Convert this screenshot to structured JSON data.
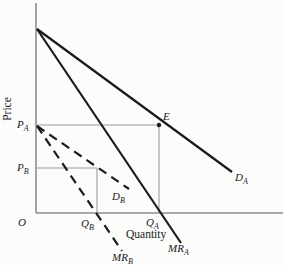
{
  "figure": {
    "background_color": "#fcfcfb",
    "curve_color": "#1a1a1a",
    "axis_color": "#8d8d8d",
    "guide_color": "#9a9a9a"
  },
  "chart_data": {
    "type": "line",
    "title": "",
    "xlabel": "Quantity",
    "ylabel": "Price",
    "units": "pixel coordinates, qualitative diagram (no numeric scale)",
    "axes": {
      "y_axis": {
        "from": [
          36,
          3
        ],
        "to": [
          36,
          213
        ]
      },
      "x_axis": {
        "from": [
          36,
          213
        ],
        "to": [
          283,
          213
        ]
      }
    },
    "series": [
      {
        "name": "demand-A",
        "label": "D",
        "sub": "A",
        "style": "solid",
        "points": [
          [
            37,
            29
          ],
          [
            232,
            172
          ]
        ],
        "label_at": [
          235,
          181
        ]
      },
      {
        "name": "marginal-revenue-A",
        "label": "MR",
        "sub": "A",
        "style": "solid",
        "points": [
          [
            37,
            29
          ],
          [
            181,
            243
          ]
        ],
        "label_at": [
          168,
          252
        ]
      },
      {
        "name": "demand-B",
        "label": "D",
        "sub": "B",
        "style": "dashed",
        "points": [
          [
            37,
            126
          ],
          [
            129,
            189
          ]
        ],
        "label_at": [
          112,
          200
        ]
      },
      {
        "name": "marginal-revenue-B",
        "label": "MR",
        "sub": "B",
        "style": "dashed",
        "points": [
          [
            37,
            126
          ],
          [
            122,
            251
          ]
        ],
        "label_at": [
          112,
          261
        ]
      }
    ],
    "guides": [
      {
        "name": "price-A-guide",
        "from": [
          36,
          125
        ],
        "to": [
          159,
          125
        ]
      },
      {
        "name": "quantity-A-guide",
        "from": [
          159,
          125
        ],
        "to": [
          159,
          213
        ]
      },
      {
        "name": "price-B-guide",
        "from": [
          36,
          168
        ],
        "to": [
          97,
          168
        ]
      },
      {
        "name": "quantity-B-guide",
        "from": [
          97,
          168
        ],
        "to": [
          97,
          213
        ]
      }
    ],
    "points": [
      {
        "name": "equilibrium-E",
        "label": "E",
        "sub": "",
        "x": 159,
        "y": 125,
        "dot": true,
        "label_at": [
          163,
          120
        ]
      }
    ],
    "tick_labels": [
      {
        "name": "price-A",
        "label": "P",
        "sub": "A",
        "at": [
          17,
          128
        ]
      },
      {
        "name": "price-B",
        "label": "P",
        "sub": "B",
        "at": [
          17,
          171
        ]
      },
      {
        "name": "origin",
        "label": "O",
        "sub": "",
        "at": [
          18,
          226
        ]
      },
      {
        "name": "quantity-B",
        "label": "Q",
        "sub": "B",
        "at": [
          81,
          227
        ]
      },
      {
        "name": "quantity-A",
        "label": "Q",
        "sub": "A",
        "at": [
          146,
          226
        ]
      }
    ],
    "axis_labels": [
      {
        "name": "price-axis-label",
        "text": "Price",
        "at": [
          11,
          109
        ],
        "rotate": -90,
        "anchor": "middle"
      },
      {
        "name": "quantity-axis-label",
        "text": "Quantity",
        "at": [
          126,
          238
        ],
        "rotate": 0,
        "anchor": "start"
      }
    ]
  }
}
